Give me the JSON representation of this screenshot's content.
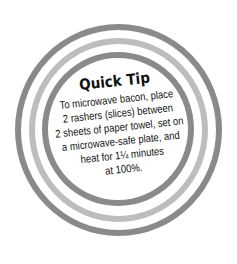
{
  "tip": {
    "title": "Quick Tip",
    "lines": [
      "To microwave bacon, place",
      "2 rashers (slices) between",
      "2 sheets of paper towel, set on",
      "a microwave-safe plate, and",
      "heat for 1¼ minutes",
      "at 100%."
    ]
  },
  "colors": {
    "ring_dark": "#8a8a8a",
    "ring_light": "#bdbdbd",
    "text": "#111111",
    "background": "#ffffff"
  }
}
